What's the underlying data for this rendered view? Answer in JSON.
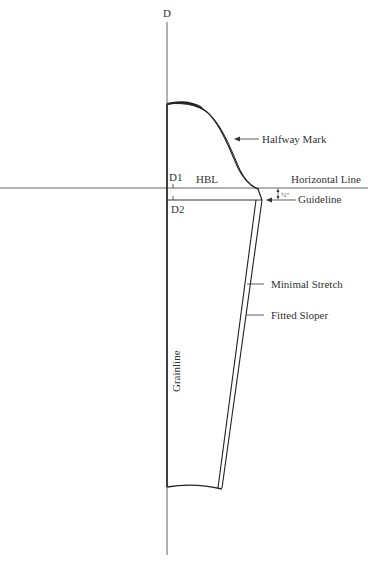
{
  "diagram": {
    "type": "sleeve-pattern-draft",
    "colors": {
      "stroke": "#222222",
      "guide": "#555555",
      "text": "#333333",
      "background": "#ffffff"
    },
    "labels": {
      "axis_top": "D",
      "d1": "D1",
      "d2": "D2",
      "hbl": "HBL",
      "horizontal_line": "Horizontal Line",
      "guideline": "Guideline",
      "half_inch": "½\"",
      "halfway_mark": "Halfway Mark",
      "minimal_stretch": "Minimal Stretch",
      "fitted_sloper": "Fitted Sloper",
      "grainline": "Grainline"
    }
  }
}
